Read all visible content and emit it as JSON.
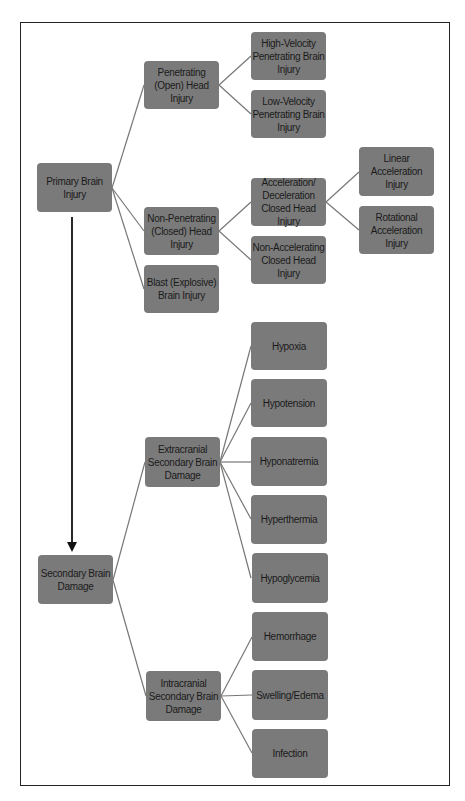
{
  "diagram": {
    "primary": {
      "label": "Primary Brain Injury",
      "children": {
        "penetrating": "Penetrating (Open) Head Injury",
        "high_velocity": "High-Velocity Penetrating Brain Injury",
        "low_velocity": "Low-Velocity Penetrating Brain Injury",
        "non_penetrating": "Non-Penetrating (Closed) Head Injury",
        "accel_decel": "Acceleration/ Deceleration Closed Head Injury",
        "linear": "Linear Acceleration Injury",
        "rotational": "Rotational Acceleration Injury",
        "non_accelerating": "Non-Accelerating Closed Head Injury",
        "blast": "Blast (Explosive) Brain Injury"
      }
    },
    "secondary": {
      "label": "Secondary Brain Damage",
      "children": {
        "extracranial": "Extracranial Secondary Brain Damage",
        "hypoxia": "Hypoxia",
        "hypotension": "Hypotension",
        "hyponatremia": "Hyponatremia",
        "hyperthermia": "Hyperthermia",
        "hypoglycemia": "Hypoglycemia",
        "intracranial": "Intracranial Secondary Brain Damage",
        "hemorrhage": "Hemorrhage",
        "swelling": "Swelling/Edema",
        "infection": "Infection"
      }
    },
    "colors": {
      "node_fill": "#7a7a7a",
      "line": "#777777",
      "arrow": "#111111",
      "frame": "#222222"
    }
  }
}
